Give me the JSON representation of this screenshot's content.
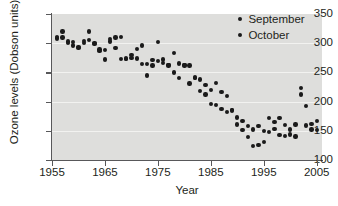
{
  "chart_data": {
    "type": "scatter",
    "title": "",
    "xlabel": "Year",
    "ylabel": "Ozone levels (Dobson units)",
    "xlim": [
      1955,
      2006
    ],
    "ylim": [
      100,
      350
    ],
    "xticks": [
      1955,
      1965,
      1975,
      1985,
      1995,
      2005
    ],
    "yticks": [
      100,
      150,
      200,
      250,
      300,
      350
    ],
    "grid": "horizontal",
    "legend_position": "top-right",
    "series": [
      {
        "name": "September",
        "color": "#1a1a1a",
        "points": [
          [
            1956,
            311
          ],
          [
            1957,
            320
          ],
          [
            1958,
            303
          ],
          [
            1959,
            302
          ],
          [
            1960,
            293
          ],
          [
            1961,
            304
          ],
          [
            1962,
            320
          ],
          [
            1963,
            300
          ],
          [
            1964,
            287
          ],
          [
            1965,
            272
          ],
          [
            1966,
            303
          ],
          [
            1967,
            292
          ],
          [
            1968,
            311
          ],
          [
            1969,
            274
          ],
          [
            1970,
            275
          ],
          [
            1971,
            290
          ],
          [
            1972,
            296
          ],
          [
            1973,
            264
          ],
          [
            1974,
            262
          ],
          [
            1975,
            302
          ],
          [
            1976,
            272
          ],
          [
            1977,
            263
          ],
          [
            1978,
            283
          ],
          [
            1979,
            265
          ],
          [
            1980,
            263
          ],
          [
            1981,
            262
          ],
          [
            1982,
            240
          ],
          [
            1983,
            238
          ],
          [
            1984,
            228
          ],
          [
            1985,
            220
          ],
          [
            1986,
            232
          ],
          [
            1987,
            216
          ],
          [
            1988,
            210
          ],
          [
            1989,
            186
          ],
          [
            1990,
            173
          ],
          [
            1991,
            167
          ],
          [
            1992,
            158
          ],
          [
            1993,
            152
          ],
          [
            1994,
            158
          ],
          [
            1995,
            150
          ],
          [
            1996,
            172
          ],
          [
            1997,
            165
          ],
          [
            1998,
            172
          ],
          [
            1999,
            160
          ],
          [
            2000,
            144
          ],
          [
            2001,
            161
          ],
          [
            2002,
            223
          ],
          [
            2003,
            193
          ],
          [
            2004,
            162
          ],
          [
            2005,
            167
          ]
        ]
      },
      {
        "name": "October",
        "color": "#1a1a1a",
        "points": [
          [
            1956,
            308
          ],
          [
            1957,
            310
          ],
          [
            1958,
            300
          ],
          [
            1959,
            296
          ],
          [
            1960,
            292
          ],
          [
            1961,
            300
          ],
          [
            1962,
            305
          ],
          [
            1963,
            299
          ],
          [
            1964,
            289
          ],
          [
            1965,
            288
          ],
          [
            1966,
            307
          ],
          [
            1967,
            310
          ],
          [
            1968,
            273
          ],
          [
            1969,
            273
          ],
          [
            1970,
            280
          ],
          [
            1971,
            274
          ],
          [
            1972,
            264
          ],
          [
            1973,
            245
          ],
          [
            1974,
            271
          ],
          [
            1975,
            270
          ],
          [
            1976,
            266
          ],
          [
            1977,
            262
          ],
          [
            1978,
            250
          ],
          [
            1979,
            240
          ],
          [
            1980,
            262
          ],
          [
            1981,
            231
          ],
          [
            1982,
            241
          ],
          [
            1983,
            218
          ],
          [
            1984,
            212
          ],
          [
            1985,
            196
          ],
          [
            1986,
            194
          ],
          [
            1987,
            187
          ],
          [
            1988,
            182
          ],
          [
            1989,
            185
          ],
          [
            1990,
            161
          ],
          [
            1991,
            151
          ],
          [
            1992,
            139
          ],
          [
            1993,
            124
          ],
          [
            1994,
            126
          ],
          [
            1995,
            131
          ],
          [
            1996,
            148
          ],
          [
            1997,
            153
          ],
          [
            1998,
            143
          ],
          [
            1999,
            141
          ],
          [
            2000,
            152
          ],
          [
            2001,
            140
          ],
          [
            2002,
            212
          ],
          [
            2003,
            159
          ],
          [
            2004,
            152
          ],
          [
            2005,
            151
          ]
        ]
      }
    ]
  },
  "legend": {
    "items": [
      {
        "label": "September"
      },
      {
        "label": "October"
      }
    ]
  }
}
